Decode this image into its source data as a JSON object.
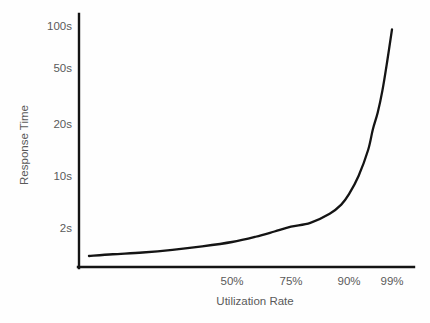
{
  "chart_data": {
    "type": "line",
    "title": "",
    "subtitle": "",
    "xlabel": "Utilization Rate",
    "ylabel": "Response Time",
    "grid": false,
    "legend": false,
    "legend_position": "none",
    "x_tick_labels": [
      "50%",
      "75%",
      "90%",
      "99%"
    ],
    "x_tick_values": [
      50,
      75,
      90,
      99
    ],
    "y_tick_labels": [
      "2s",
      "10s",
      "20s",
      "50s",
      "100s"
    ],
    "y_tick_values": [
      2,
      10,
      20,
      50,
      100
    ],
    "xlim": [
      0,
      100
    ],
    "ylim": [
      0,
      115
    ],
    "series": [
      {
        "name": "Response Time vs Utilization",
        "color": "#141414",
        "x": [
          2,
          10,
          20,
          30,
          40,
          50,
          60,
          68,
          75,
          80,
          85,
          88,
          90,
          92,
          94,
          95,
          96,
          97,
          98,
          99
        ],
        "y": [
          0.4,
          0.5,
          0.6,
          0.75,
          0.95,
          1.2,
          1.5,
          1.8,
          2.2,
          2.8,
          4.2,
          5.6,
          7.2,
          10.0,
          15.0,
          19.0,
          26.0,
          38.0,
          58.0,
          96.0
        ]
      }
    ],
    "annotations": []
  },
  "axes": {
    "y_label": "Response Time",
    "x_label": "Utilization Rate",
    "y_ticks": [
      {
        "label": "100s",
        "x": 68,
        "y": 30
      },
      {
        "label": "50s",
        "x": 68,
        "y": 72
      },
      {
        "label": "20s",
        "x": 68,
        "y": 128
      },
      {
        "label": "10s",
        "x": 68,
        "y": 180
      },
      {
        "label": "2s",
        "x": 68,
        "y": 232
      }
    ],
    "x_ticks": [
      {
        "label": "50%",
        "x": 232,
        "y": 285
      },
      {
        "label": "75%",
        "x": 291,
        "y": 285
      },
      {
        "label": "90%",
        "x": 349,
        "y": 285
      },
      {
        "label": "99%",
        "x": 392,
        "y": 285
      }
    ]
  },
  "colors": {
    "background": "#fefefe",
    "axis": "#141414",
    "curve": "#141414",
    "text": "#5a5a5a"
  }
}
